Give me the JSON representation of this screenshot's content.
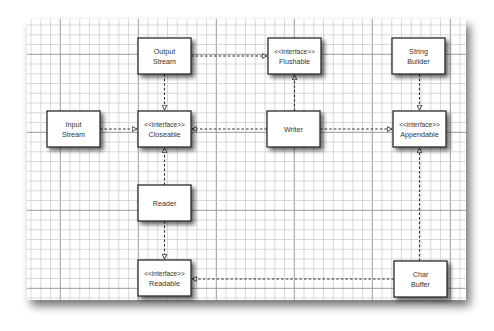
{
  "diagram": {
    "type": "uml-class-relationships",
    "nodes": [
      {
        "id": "output_stream",
        "stereotype": "",
        "line1": "Output",
        "line2": "Stream",
        "x": 138,
        "y": 38,
        "w": 53,
        "h": 36
      },
      {
        "id": "flushable",
        "stereotype": "<<interface>>",
        "line1": "Flushable",
        "line2": "",
        "x": 268,
        "y": 38,
        "w": 53,
        "h": 36
      },
      {
        "id": "string_builder",
        "stereotype": "",
        "line1": "String",
        "line2": "Builder",
        "x": 392,
        "y": 38,
        "w": 53,
        "h": 36
      },
      {
        "id": "input_stream",
        "stereotype": "",
        "line1": "Input",
        "line2": "Stream",
        "x": 47,
        "y": 111,
        "w": 53,
        "h": 36
      },
      {
        "id": "closeable",
        "stereotype": "<<interface>>",
        "line1": "Closeable",
        "line2": "",
        "x": 138,
        "y": 111,
        "w": 53,
        "h": 36
      },
      {
        "id": "writer",
        "stereotype": "",
        "line1": "Writer",
        "line2": "",
        "x": 267,
        "y": 111,
        "w": 53,
        "h": 36
      },
      {
        "id": "appendable",
        "stereotype": "<<interface>>",
        "line1": "Appendable",
        "line2": "",
        "x": 393,
        "y": 111,
        "w": 53,
        "h": 36
      },
      {
        "id": "reader",
        "stereotype": "",
        "line1": "Reader",
        "line2": "",
        "x": 138,
        "y": 185,
        "w": 53,
        "h": 36
      },
      {
        "id": "readable",
        "stereotype": "<<interface>>",
        "line1": "Readable",
        "line2": "",
        "x": 138,
        "y": 260,
        "w": 53,
        "h": 36
      },
      {
        "id": "char_buffer",
        "stereotype": "",
        "line1": "Char",
        "line2": "Buffer",
        "x": 394,
        "y": 261,
        "w": 53,
        "h": 36
      }
    ],
    "edges": [
      {
        "from": "output_stream",
        "to": "flushable",
        "kind": "realization"
      },
      {
        "from": "output_stream",
        "to": "closeable",
        "kind": "realization"
      },
      {
        "from": "input_stream",
        "to": "closeable",
        "kind": "realization"
      },
      {
        "from": "writer",
        "to": "closeable",
        "kind": "realization"
      },
      {
        "from": "writer",
        "to": "flushable",
        "kind": "realization"
      },
      {
        "from": "writer",
        "to": "appendable",
        "kind": "realization"
      },
      {
        "from": "string_builder",
        "to": "appendable",
        "kind": "realization"
      },
      {
        "from": "reader",
        "to": "closeable",
        "kind": "realization"
      },
      {
        "from": "reader",
        "to": "readable",
        "kind": "realization"
      },
      {
        "from": "char_buffer",
        "to": "readable",
        "kind": "realization"
      },
      {
        "from": "char_buffer",
        "to": "appendable",
        "kind": "realization"
      }
    ],
    "colors": {
      "paper": "#ffffff",
      "grid_minor": "#c8c8c8",
      "grid_major": "#9a9a9a",
      "box_border": "#2a2a2a",
      "edge": "#333333",
      "text": "#333333"
    }
  }
}
